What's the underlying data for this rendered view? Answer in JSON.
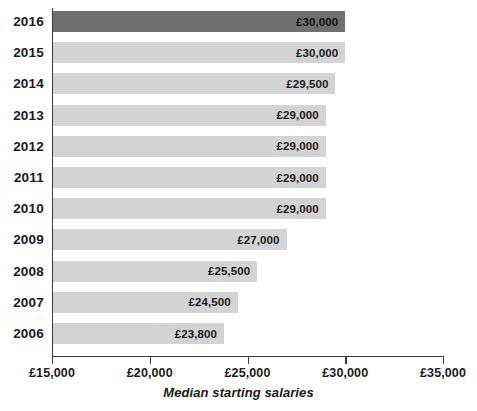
{
  "chart_data": {
    "type": "bar",
    "orientation": "horizontal",
    "title": "",
    "xlabel": "Median starting salaries",
    "ylabel": "",
    "xlim": [
      15000,
      35000
    ],
    "xticks": [
      15000,
      20000,
      25000,
      30000,
      35000
    ],
    "xtick_labels": [
      "£15,000",
      "£20,000",
      "£25,000",
      "£30,000",
      "£35,000"
    ],
    "grid": false,
    "legend": false,
    "categories": [
      "2016",
      "2015",
      "2014",
      "2013",
      "2012",
      "2011",
      "2010",
      "2009",
      "2008",
      "2007",
      "2006"
    ],
    "values": [
      30000,
      30000,
      29500,
      29000,
      29000,
      29000,
      29000,
      27000,
      25500,
      24500,
      23800
    ],
    "value_labels": [
      "£30,000",
      "£30,000",
      "£29,500",
      "£29,000",
      "£29,000",
      "£29,000",
      "£29,000",
      "£27,000",
      "£25,500",
      "£24,500",
      "£23,800"
    ],
    "bars": [
      {
        "category": "2016",
        "value": 30000,
        "label": "£30,000",
        "highlight": true
      },
      {
        "category": "2015",
        "value": 30000,
        "label": "£30,000",
        "highlight": false
      },
      {
        "category": "2014",
        "value": 29500,
        "label": "£29,500",
        "highlight": false
      },
      {
        "category": "2013",
        "value": 29000,
        "label": "£29,000",
        "highlight": false
      },
      {
        "category": "2012",
        "value": 29000,
        "label": "£29,000",
        "highlight": false
      },
      {
        "category": "2011",
        "value": 29000,
        "label": "£29,000",
        "highlight": false
      },
      {
        "category": "2010",
        "value": 29000,
        "label": "£29,000",
        "highlight": false
      },
      {
        "category": "2009",
        "value": 27000,
        "label": "£27,000",
        "highlight": false
      },
      {
        "category": "2008",
        "value": 25500,
        "label": "£25,500",
        "highlight": false
      },
      {
        "category": "2007",
        "value": 24500,
        "label": "£24,500",
        "highlight": false
      },
      {
        "category": "2006",
        "value": 23800,
        "label": "£23,800",
        "highlight": false
      }
    ],
    "colors": {
      "bar": "#d3d3d3",
      "bar_highlight": "#6f6f6f",
      "axis": "#3a3a3a",
      "text": "#1a1a1a",
      "background": "#ffffff"
    }
  }
}
